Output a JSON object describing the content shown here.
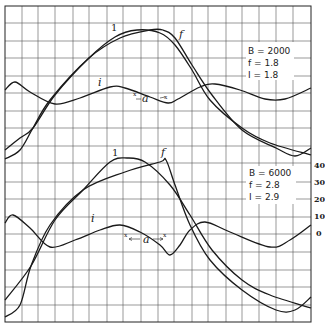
{
  "chart_data": [
    {
      "type": "line",
      "title": "",
      "panel": "top",
      "legend": {
        "lines": [
          "B = 2000",
          "f = 1.8",
          "I = 1.8"
        ],
        "B": 2000,
        "f": 1.8,
        "I": 1.8
      },
      "grid": true,
      "series": [
        {
          "name": "1",
          "label": "1",
          "points": [
            [
              5,
              150
            ],
            [
              20,
              138
            ],
            [
              33,
              128
            ],
            [
              55,
              95
            ],
            [
              89,
              58
            ],
            [
              115,
              37
            ],
            [
              137,
              30
            ],
            [
              160,
              33
            ],
            [
              175,
              45
            ],
            [
              192,
              70
            ],
            [
              210,
              100
            ],
            [
              242,
              128
            ],
            [
              270,
              143
            ],
            [
              311,
              155
            ]
          ]
        },
        {
          "name": "f",
          "label": "f",
          "points": [
            [
              5,
              159
            ],
            [
              20,
              150
            ],
            [
              33,
              128
            ],
            [
              50,
              100
            ],
            [
              89,
              58
            ],
            [
              120,
              38
            ],
            [
              150,
              30
            ],
            [
              163,
              30
            ],
            [
              175,
              38
            ],
            [
              192,
              65
            ],
            [
              212,
              95
            ],
            [
              242,
              130
            ],
            [
              276,
              148
            ],
            [
              295,
              156
            ],
            [
              311,
              148
            ]
          ]
        },
        {
          "name": "i",
          "label": "i",
          "points": [
            [
              5,
              90
            ],
            [
              15,
              82
            ],
            [
              30,
              92
            ],
            [
              55,
              104
            ],
            [
              80,
              98
            ],
            [
              110,
              87
            ],
            [
              125,
              88
            ],
            [
              150,
              97
            ],
            [
              168,
              103
            ],
            [
              178,
              99
            ],
            [
              200,
              87
            ],
            [
              215,
              84
            ],
            [
              240,
              90
            ],
            [
              265,
              99
            ],
            [
              285,
              99
            ],
            [
              311,
              88
            ]
          ]
        }
      ],
      "annotations": [
        "1",
        "f",
        "i",
        "a"
      ]
    },
    {
      "type": "line",
      "title": "",
      "panel": "bottom",
      "legend": {
        "lines": [
          "B = 6000",
          "f = 2.8",
          "I = 2.9"
        ],
        "B": 6000,
        "f": 2.8,
        "I": 2.9
      },
      "grid": true,
      "y_ticks_right": [
        "40",
        "30",
        "20",
        "10",
        "0"
      ],
      "ylim": [
        -50,
        40
      ],
      "series": [
        {
          "name": "1",
          "label": "1",
          "points": [
            [
              5,
              300
            ],
            [
              31,
              266
            ],
            [
              55,
              220
            ],
            [
              83,
              190
            ],
            [
              110,
              162
            ],
            [
              127,
              158
            ],
            [
              145,
              162
            ],
            [
              170,
              185
            ],
            [
              190,
              215
            ],
            [
              212,
              250
            ],
            [
              242,
              280
            ],
            [
              270,
              295
            ],
            [
              311,
              308
            ]
          ]
        },
        {
          "name": "f",
          "label": "f",
          "points": [
            [
              5,
              317
            ],
            [
              20,
              305
            ],
            [
              31,
              266
            ],
            [
              50,
              225
            ],
            [
              83,
              190
            ],
            [
              125,
              172
            ],
            [
              160,
              162
            ],
            [
              166,
              160
            ],
            [
              175,
              185
            ],
            [
              190,
              225
            ],
            [
              210,
              260
            ],
            [
              242,
              290
            ],
            [
              276,
              310
            ],
            [
              295,
              310
            ],
            [
              311,
              297
            ]
          ]
        },
        {
          "name": "i",
          "label": "i",
          "points": [
            [
              5,
              223
            ],
            [
              13,
              215
            ],
            [
              30,
              228
            ],
            [
              50,
              247
            ],
            [
              75,
              240
            ],
            [
              100,
              230
            ],
            [
              120,
              225
            ],
            [
              140,
              232
            ],
            [
              160,
              245
            ],
            [
              170,
              255
            ],
            [
              180,
              245
            ],
            [
              190,
              230
            ],
            [
              205,
              222
            ],
            [
              230,
              232
            ],
            [
              270,
              247
            ],
            [
              290,
              240
            ],
            [
              311,
              225
            ]
          ]
        }
      ],
      "annotations": [
        "1",
        "f",
        "i",
        "a"
      ]
    }
  ],
  "top": {
    "legend": [
      "B = 2000",
      "f = 1.8",
      "I = 1.8"
    ],
    "labels": {
      "one": "1",
      "f": "f",
      "i": "i",
      "a": "a",
      "x": "x"
    }
  },
  "bottom": {
    "legend": [
      "B = 6000",
      "f = 2.8",
      "I = 2.9"
    ],
    "labels": {
      "one": "1",
      "f": "f",
      "i": "i",
      "a": "a",
      "x": "x"
    },
    "ticks": [
      "40",
      "30",
      "20",
      "10",
      "0"
    ]
  }
}
